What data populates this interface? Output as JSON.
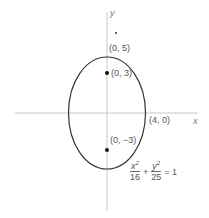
{
  "diagram": {
    "axes": {
      "x_label": "x",
      "y_label": "y",
      "color": "#c8c8c8"
    },
    "ellipse": {
      "center": [
        0,
        0
      ],
      "a": 4,
      "b": 5,
      "stroke": "#333333"
    },
    "labels": {
      "vertex_top": "(0, 5)",
      "focus_top": "(0, 3)",
      "vertex_right": "(4, 0)",
      "focus_bottom": "(0, −3)"
    },
    "equation": {
      "x_num": "x",
      "x_exp": "2",
      "x_den": "16",
      "plus": "+",
      "y_num": "y",
      "y_exp": "2",
      "y_den": "25",
      "equals": "= 1"
    },
    "points": [
      {
        "name": "focus-top",
        "coords": [
          0,
          3
        ]
      },
      {
        "name": "focus-bottom",
        "coords": [
          0,
          -3
        ]
      }
    ]
  }
}
